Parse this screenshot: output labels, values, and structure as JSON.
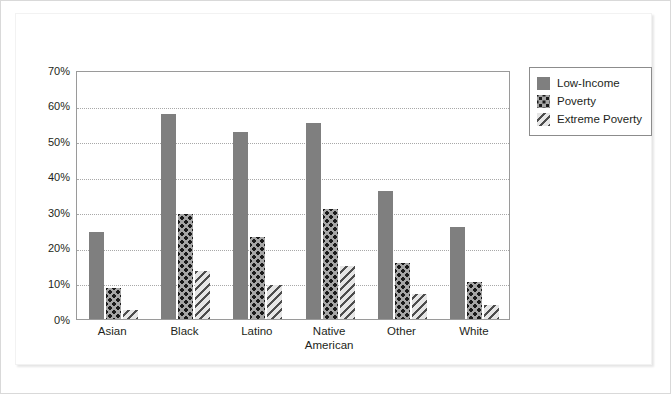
{
  "chart_data": {
    "type": "bar",
    "title": "",
    "subtitle": "",
    "xlabel": "",
    "ylabel": "",
    "ylim": [
      0,
      70
    ],
    "y_tick_labels": [
      "70%",
      "60%",
      "50%",
      "40%",
      "30%",
      "20%",
      "10%",
      "0%"
    ],
    "y_tick_values": [
      70,
      60,
      50,
      40,
      30,
      20,
      10,
      0
    ],
    "grid": true,
    "grid_axis": "y",
    "legend_position": "right",
    "categories": [
      "Asian",
      "Black",
      "Latino",
      "Native American",
      "Other",
      "White"
    ],
    "category_label_lines": [
      [
        "Asian"
      ],
      [
        "Black"
      ],
      [
        "Latino"
      ],
      [
        "Native",
        "American"
      ],
      [
        "Other"
      ],
      [
        "White"
      ]
    ],
    "series": [
      {
        "name": "Low-Income",
        "fill": "solid",
        "color": "#7f7f7f",
        "values": [
          24.5,
          57.5,
          52.5,
          55.0,
          36.0,
          26.0
        ]
      },
      {
        "name": "Poverty",
        "fill": "dotted",
        "color": "#a6a6a6",
        "values": [
          8.7,
          29.5,
          23.0,
          30.8,
          15.8,
          10.4
        ]
      },
      {
        "name": "Extreme Poverty",
        "fill": "diagonal-hatch",
        "color": "#bdbdbd",
        "values": [
          2.5,
          13.5,
          9.7,
          14.8,
          7.0,
          4.0
        ]
      }
    ]
  },
  "legend": {
    "items": [
      {
        "label": "Low-Income",
        "swatch": "low-income"
      },
      {
        "label": "Poverty",
        "swatch": "poverty"
      },
      {
        "label": "Extreme Poverty",
        "swatch": "extreme"
      }
    ]
  }
}
